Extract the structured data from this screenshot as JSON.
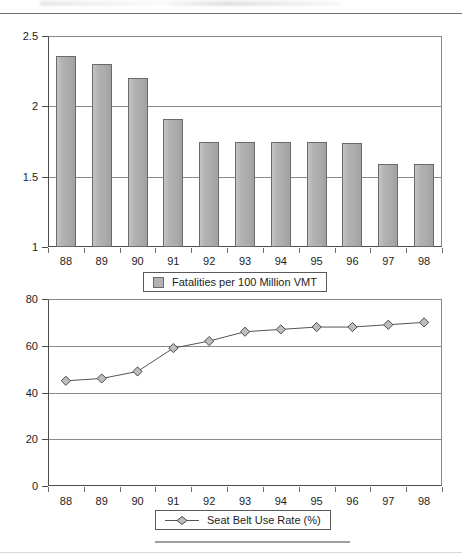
{
  "page": {
    "background": "#ffffff",
    "width": 462,
    "height": 559
  },
  "colors": {
    "bar_fill": "#b3b3b3",
    "bar_stroke": "#6a6a6a",
    "line_stroke": "#555555",
    "marker_fill": "#bdbdbd",
    "marker_stroke": "#4a4a4a",
    "axis": "#4d4d4d",
    "gridline": "#8a8a8a",
    "text": "#1c1c1c"
  },
  "chart_data": [
    {
      "id": "fatalities-chart",
      "type": "bar",
      "title": "",
      "xlabel": "",
      "ylabel": "",
      "categories": [
        "88",
        "89",
        "90",
        "91",
        "92",
        "93",
        "94",
        "95",
        "96",
        "97",
        "98"
      ],
      "values": [
        2.36,
        2.3,
        2.2,
        1.91,
        1.75,
        1.75,
        1.75,
        1.75,
        1.74,
        1.59,
        1.59
      ],
      "ylim": [
        1,
        2.5
      ],
      "yticks": [
        1,
        1.5,
        2,
        2.5
      ],
      "ytick_labels": [
        "1",
        "1.5",
        "2",
        "2.5"
      ],
      "grid": true,
      "legend_position": "bottom",
      "legend": [
        {
          "label": "Fatalities per 100 Million VMT",
          "marker": "square-swatch"
        }
      ]
    },
    {
      "id": "seatbelt-chart",
      "type": "line",
      "title": "",
      "xlabel": "",
      "ylabel": "",
      "categories": [
        "88",
        "89",
        "90",
        "91",
        "92",
        "93",
        "94",
        "95",
        "96",
        "97",
        "98"
      ],
      "values": [
        45,
        46,
        49,
        59,
        62,
        66,
        67,
        68,
        68,
        69,
        70
      ],
      "ylim": [
        0,
        80
      ],
      "yticks": [
        0,
        20,
        40,
        60,
        80
      ],
      "ytick_labels": [
        "0",
        "20",
        "40",
        "60",
        "80"
      ],
      "grid": true,
      "legend_position": "bottom",
      "legend": [
        {
          "label": "Seat Belt Use Rate (%)",
          "marker": "diamond-line"
        }
      ]
    }
  ]
}
